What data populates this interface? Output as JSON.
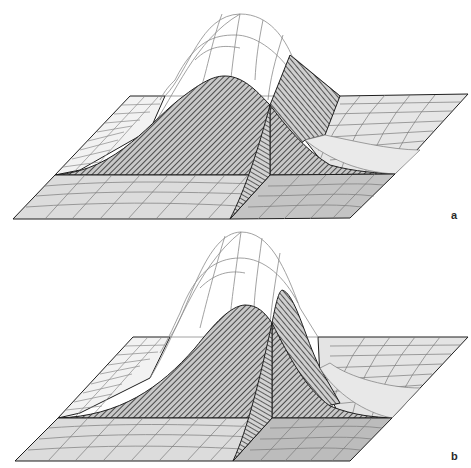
{
  "figure": {
    "panels": [
      {
        "id": "a",
        "label": "a"
      },
      {
        "id": "b",
        "label": "b"
      }
    ]
  },
  "colors": {
    "background": "#ffffff",
    "outline": "#1e1e1e",
    "grid_line": "#7a7a7a",
    "wire_line": "#8a8a8a",
    "slab_left_fill": "#dcdcdc",
    "slab_right_fill": "#c4c4c4",
    "back_plane_fill": "#e8e8e8",
    "hatch_fill": "#b4b4b4",
    "hatch_line": "#2a2a2a"
  }
}
